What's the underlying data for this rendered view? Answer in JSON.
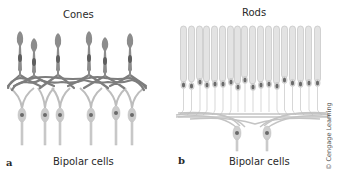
{
  "panels": {
    "a": {
      "letter": "a",
      "title": "Cones",
      "bottom_label": "Bipolar cells"
    },
    "b": {
      "letter": "b",
      "title": "Rods",
      "bottom_label": "Bipolar cells"
    }
  },
  "credit": "© Cengage Learning",
  "colors": {
    "cone_fill": "#8a8a8a",
    "cone_nucleus": "#5e5e5e",
    "cone_network": "#7a7a7a",
    "rod_fill": "#e2e2e2",
    "rod_outline": "#bdbdbd",
    "rod_nucleus": "#6a6a6a",
    "bipolar_fill": "#c9c9c9",
    "bipolar_nucleus": "#6a6a6a",
    "text": "#2a2a2a"
  }
}
